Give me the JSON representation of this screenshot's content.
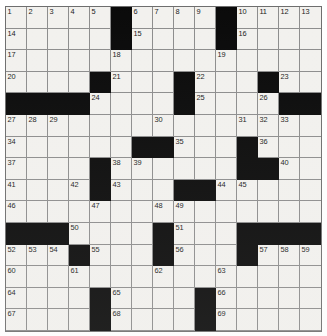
{
  "puzzle": {
    "title": "Crossword Puzzle Grid",
    "rows": 15,
    "cols": 15,
    "cell_background": "#f2f1ee",
    "block_color": "#0a0a0a",
    "grid_line_color": "#8d8d8d",
    "number_color": "#1a1a1a",
    "highest_clue_number": 69,
    "total_cells": 225,
    "block_count": 54,
    "grid": [
      {
        "row": 1,
        "cells": [
          {
            "block": false,
            "number": "1"
          },
          {
            "block": false,
            "number": "2"
          },
          {
            "block": false,
            "number": "3"
          },
          {
            "block": false,
            "number": "4"
          },
          {
            "block": false,
            "number": "5"
          },
          {
            "block": true,
            "number": ""
          },
          {
            "block": false,
            "number": "6"
          },
          {
            "block": false,
            "number": "7"
          },
          {
            "block": false,
            "number": "8"
          },
          {
            "block": false,
            "number": "9"
          },
          {
            "block": true,
            "number": ""
          },
          {
            "block": false,
            "number": "10"
          },
          {
            "block": false,
            "number": "11"
          },
          {
            "block": false,
            "number": "12"
          },
          {
            "block": false,
            "number": "13"
          }
        ]
      },
      {
        "row": 2,
        "cells": [
          {
            "block": false,
            "number": "14"
          },
          {
            "block": false,
            "number": ""
          },
          {
            "block": false,
            "number": ""
          },
          {
            "block": false,
            "number": ""
          },
          {
            "block": false,
            "number": ""
          },
          {
            "block": true,
            "number": ""
          },
          {
            "block": false,
            "number": "15"
          },
          {
            "block": false,
            "number": ""
          },
          {
            "block": false,
            "number": ""
          },
          {
            "block": false,
            "number": ""
          },
          {
            "block": true,
            "number": ""
          },
          {
            "block": false,
            "number": "16"
          },
          {
            "block": false,
            "number": ""
          },
          {
            "block": false,
            "number": ""
          },
          {
            "block": false,
            "number": ""
          }
        ]
      },
      {
        "row": 3,
        "cells": [
          {
            "block": false,
            "number": "17"
          },
          {
            "block": false,
            "number": ""
          },
          {
            "block": false,
            "number": ""
          },
          {
            "block": false,
            "number": ""
          },
          {
            "block": false,
            "number": ""
          },
          {
            "block": false,
            "number": "18"
          },
          {
            "block": false,
            "number": ""
          },
          {
            "block": false,
            "number": ""
          },
          {
            "block": false,
            "number": ""
          },
          {
            "block": false,
            "number": ""
          },
          {
            "block": false,
            "number": "19"
          },
          {
            "block": false,
            "number": ""
          },
          {
            "block": false,
            "number": ""
          },
          {
            "block": false,
            "number": ""
          },
          {
            "block": false,
            "number": ""
          }
        ]
      },
      {
        "row": 4,
        "cells": [
          {
            "block": false,
            "number": "20"
          },
          {
            "block": false,
            "number": ""
          },
          {
            "block": false,
            "number": ""
          },
          {
            "block": false,
            "number": ""
          },
          {
            "block": true,
            "number": ""
          },
          {
            "block": false,
            "number": "21"
          },
          {
            "block": false,
            "number": ""
          },
          {
            "block": false,
            "number": ""
          },
          {
            "block": true,
            "number": ""
          },
          {
            "block": false,
            "number": "22"
          },
          {
            "block": false,
            "number": ""
          },
          {
            "block": false,
            "number": ""
          },
          {
            "block": true,
            "number": ""
          },
          {
            "block": false,
            "number": "23"
          },
          {
            "block": false,
            "number": ""
          }
        ]
      },
      {
        "row": 5,
        "cells": [
          {
            "block": true,
            "number": ""
          },
          {
            "block": true,
            "number": ""
          },
          {
            "block": true,
            "number": ""
          },
          {
            "block": true,
            "number": ""
          },
          {
            "block": false,
            "number": "24"
          },
          {
            "block": false,
            "number": ""
          },
          {
            "block": false,
            "number": ""
          },
          {
            "block": false,
            "number": ""
          },
          {
            "block": true,
            "number": ""
          },
          {
            "block": false,
            "number": "25"
          },
          {
            "block": false,
            "number": ""
          },
          {
            "block": false,
            "number": ""
          },
          {
            "block": false,
            "number": "26"
          },
          {
            "block": true,
            "number": ""
          },
          {
            "block": true,
            "number": ""
          }
        ]
      },
      {
        "row": 6,
        "cells": [
          {
            "block": false,
            "number": "27"
          },
          {
            "block": false,
            "number": "28"
          },
          {
            "block": false,
            "number": "29"
          },
          {
            "block": false,
            "number": ""
          },
          {
            "block": false,
            "number": ""
          },
          {
            "block": false,
            "number": ""
          },
          {
            "block": false,
            "number": ""
          },
          {
            "block": false,
            "number": "30"
          },
          {
            "block": false,
            "number": ""
          },
          {
            "block": false,
            "number": ""
          },
          {
            "block": false,
            "number": ""
          },
          {
            "block": false,
            "number": "31"
          },
          {
            "block": false,
            "number": "32"
          },
          {
            "block": false,
            "number": "33"
          },
          {
            "block": false,
            "number": ""
          }
        ]
      },
      {
        "row": 7,
        "cells": [
          {
            "block": false,
            "number": "34"
          },
          {
            "block": false,
            "number": ""
          },
          {
            "block": false,
            "number": ""
          },
          {
            "block": false,
            "number": ""
          },
          {
            "block": false,
            "number": ""
          },
          {
            "block": false,
            "number": ""
          },
          {
            "block": true,
            "number": ""
          },
          {
            "block": true,
            "number": ""
          },
          {
            "block": false,
            "number": "35"
          },
          {
            "block": false,
            "number": ""
          },
          {
            "block": false,
            "number": ""
          },
          {
            "block": true,
            "number": ""
          },
          {
            "block": false,
            "number": "36"
          },
          {
            "block": false,
            "number": ""
          },
          {
            "block": false,
            "number": ""
          }
        ]
      },
      {
        "row": 8,
        "cells": [
          {
            "block": false,
            "number": "37"
          },
          {
            "block": false,
            "number": ""
          },
          {
            "block": false,
            "number": ""
          },
          {
            "block": false,
            "number": ""
          },
          {
            "block": true,
            "number": ""
          },
          {
            "block": false,
            "number": "38"
          },
          {
            "block": false,
            "number": "39"
          },
          {
            "block": false,
            "number": ""
          },
          {
            "block": false,
            "number": ""
          },
          {
            "block": false,
            "number": ""
          },
          {
            "block": false,
            "number": ""
          },
          {
            "block": true,
            "number": ""
          },
          {
            "block": true,
            "number": ""
          },
          {
            "block": false,
            "number": "40"
          },
          {
            "block": false,
            "number": ""
          }
        ]
      },
      {
        "row": 9,
        "cells": [
          {
            "block": false,
            "number": "41"
          },
          {
            "block": false,
            "number": ""
          },
          {
            "block": false,
            "number": ""
          },
          {
            "block": false,
            "number": "42"
          },
          {
            "block": true,
            "number": ""
          },
          {
            "block": false,
            "number": "43"
          },
          {
            "block": false,
            "number": ""
          },
          {
            "block": false,
            "number": ""
          },
          {
            "block": true,
            "number": ""
          },
          {
            "block": true,
            "number": ""
          },
          {
            "block": false,
            "number": "44"
          },
          {
            "block": false,
            "number": "45"
          },
          {
            "block": false,
            "number": ""
          },
          {
            "block": false,
            "number": ""
          },
          {
            "block": false,
            "number": ""
          }
        ]
      },
      {
        "row": 10,
        "cells": [
          {
            "block": false,
            "number": "46"
          },
          {
            "block": false,
            "number": ""
          },
          {
            "block": false,
            "number": ""
          },
          {
            "block": false,
            "number": ""
          },
          {
            "block": false,
            "number": "47"
          },
          {
            "block": false,
            "number": ""
          },
          {
            "block": false,
            "number": ""
          },
          {
            "block": false,
            "number": "48"
          },
          {
            "block": false,
            "number": "49"
          },
          {
            "block": false,
            "number": ""
          },
          {
            "block": false,
            "number": ""
          },
          {
            "block": false,
            "number": ""
          },
          {
            "block": false,
            "number": ""
          },
          {
            "block": false,
            "number": ""
          },
          {
            "block": false,
            "number": ""
          }
        ]
      },
      {
        "row": 11,
        "cells": [
          {
            "block": true,
            "number": ""
          },
          {
            "block": true,
            "number": ""
          },
          {
            "block": true,
            "number": ""
          },
          {
            "block": false,
            "number": "50"
          },
          {
            "block": false,
            "number": ""
          },
          {
            "block": false,
            "number": ""
          },
          {
            "block": false,
            "number": ""
          },
          {
            "block": true,
            "number": ""
          },
          {
            "block": false,
            "number": "51"
          },
          {
            "block": false,
            "number": ""
          },
          {
            "block": false,
            "number": ""
          },
          {
            "block": true,
            "number": ""
          },
          {
            "block": true,
            "number": ""
          },
          {
            "block": true,
            "number": ""
          },
          {
            "block": true,
            "number": ""
          }
        ]
      },
      {
        "row": 12,
        "cells": [
          {
            "block": false,
            "number": "52"
          },
          {
            "block": false,
            "number": "53"
          },
          {
            "block": false,
            "number": "54"
          },
          {
            "block": true,
            "number": ""
          },
          {
            "block": false,
            "number": "55"
          },
          {
            "block": false,
            "number": ""
          },
          {
            "block": false,
            "number": ""
          },
          {
            "block": true,
            "number": ""
          },
          {
            "block": false,
            "number": "56"
          },
          {
            "block": false,
            "number": ""
          },
          {
            "block": false,
            "number": ""
          },
          {
            "block": true,
            "number": ""
          },
          {
            "block": false,
            "number": "57"
          },
          {
            "block": false,
            "number": "58"
          },
          {
            "block": false,
            "number": "59"
          }
        ]
      },
      {
        "row": 13,
        "cells": [
          {
            "block": false,
            "number": "60"
          },
          {
            "block": false,
            "number": ""
          },
          {
            "block": false,
            "number": ""
          },
          {
            "block": false,
            "number": "61"
          },
          {
            "block": false,
            "number": ""
          },
          {
            "block": false,
            "number": ""
          },
          {
            "block": false,
            "number": ""
          },
          {
            "block": false,
            "number": "62"
          },
          {
            "block": false,
            "number": ""
          },
          {
            "block": false,
            "number": ""
          },
          {
            "block": false,
            "number": "63"
          },
          {
            "block": false,
            "number": ""
          },
          {
            "block": false,
            "number": ""
          },
          {
            "block": false,
            "number": ""
          },
          {
            "block": false,
            "number": ""
          }
        ]
      },
      {
        "row": 14,
        "cells": [
          {
            "block": false,
            "number": "64"
          },
          {
            "block": false,
            "number": ""
          },
          {
            "block": false,
            "number": ""
          },
          {
            "block": false,
            "number": ""
          },
          {
            "block": true,
            "number": ""
          },
          {
            "block": false,
            "number": "65"
          },
          {
            "block": false,
            "number": ""
          },
          {
            "block": false,
            "number": ""
          },
          {
            "block": false,
            "number": ""
          },
          {
            "block": true,
            "number": ""
          },
          {
            "block": false,
            "number": "66"
          },
          {
            "block": false,
            "number": ""
          },
          {
            "block": false,
            "number": ""
          },
          {
            "block": false,
            "number": ""
          },
          {
            "block": false,
            "number": ""
          }
        ]
      },
      {
        "row": 15,
        "cells": [
          {
            "block": false,
            "number": "67"
          },
          {
            "block": false,
            "number": ""
          },
          {
            "block": false,
            "number": ""
          },
          {
            "block": false,
            "number": ""
          },
          {
            "block": true,
            "number": ""
          },
          {
            "block": false,
            "number": "68"
          },
          {
            "block": false,
            "number": ""
          },
          {
            "block": false,
            "number": ""
          },
          {
            "block": false,
            "number": ""
          },
          {
            "block": true,
            "number": ""
          },
          {
            "block": false,
            "number": "69"
          },
          {
            "block": false,
            "number": ""
          },
          {
            "block": false,
            "number": ""
          },
          {
            "block": false,
            "number": ""
          },
          {
            "block": false,
            "number": ""
          }
        ]
      }
    ]
  }
}
